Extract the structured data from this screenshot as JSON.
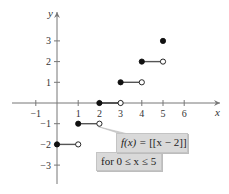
{
  "chart_data": {
    "type": "step",
    "title": "",
    "function_label": "f(x) = [[x − 2]]",
    "domain_label": "for 0 ≤ x ≤ 5",
    "xlabel": "x",
    "ylabel": "y",
    "xlim": [
      -1.5,
      6.8
    ],
    "ylim": [
      -3.7,
      4.0
    ],
    "x_ticks": [
      -1,
      1,
      2,
      3,
      4,
      5,
      6
    ],
    "y_ticks": [
      -3,
      -2,
      -1,
      1,
      2,
      3
    ],
    "grid": false,
    "segments": [
      {
        "x_start": 0,
        "x_end": 1,
        "y": -2,
        "start_closed": true,
        "end_closed": false
      },
      {
        "x_start": 1,
        "x_end": 2,
        "y": -1,
        "start_closed": true,
        "end_closed": false
      },
      {
        "x_start": 2,
        "x_end": 3,
        "y": 0,
        "start_closed": true,
        "end_closed": false
      },
      {
        "x_start": 3,
        "x_end": 4,
        "y": 1,
        "start_closed": true,
        "end_closed": false
      },
      {
        "x_start": 4,
        "x_end": 5,
        "y": 2,
        "start_closed": true,
        "end_closed": false
      }
    ],
    "points": [
      {
        "x": 5,
        "y": 3,
        "closed": true
      }
    ]
  },
  "labels": {
    "x_axis": "x",
    "y_axis": "y",
    "func_prefix": "f(x) = ",
    "func_body": "[[x − 2]]",
    "domain": "for 0 ≤ x ≤ 5"
  },
  "colors": {
    "axis": "#777777",
    "segment": "#555555",
    "point": "#111111",
    "callout_bg": "#d9d9d9",
    "callout_border": "#c4c4c4"
  }
}
